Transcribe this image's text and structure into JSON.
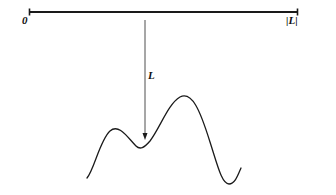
{
  "figure": {
    "title": "",
    "type": "mathematical-diagram",
    "width": 336,
    "height": 195,
    "background_color": "#ffffff",
    "stroke_color": "#1a1a1a"
  },
  "interval": {
    "name": "horizontal-interval-line",
    "left_label": "0",
    "right_label": "|L|",
    "x_start": 29,
    "x_end": 298,
    "y": 12,
    "stroke_width": 2.0,
    "endpoint_tick_height": 5
  },
  "arrow": {
    "name": "downward-mapping-arrow",
    "label": "L",
    "x": 145,
    "y_start": 20,
    "y_end": 140,
    "stroke_width": 0.9,
    "head_width": 5,
    "head_length": 9
  },
  "curve": {
    "name": "wavy-function-curve",
    "stroke_width": 1.3,
    "path": "M 87 178 C 94 170, 100 140, 110 131 C 119 123, 128 138, 136 146 C 140 150, 144 148, 150 141 C 160 128, 168 104, 180 97 C 192 91, 200 110, 210 142 C 218 167, 222 184, 229 184 C 235 184, 238 175, 241 168",
    "key_points": [
      {
        "label": "start",
        "x": 87,
        "y": 178
      },
      {
        "label": "local-maximum-left",
        "x": 110,
        "y": 130
      },
      {
        "label": "local-minimum-middle",
        "x": 142,
        "y": 148
      },
      {
        "label": "global-maximum",
        "x": 181,
        "y": 96
      },
      {
        "label": "global-minimum",
        "x": 227,
        "y": 184
      },
      {
        "label": "end",
        "x": 241,
        "y": 168
      }
    ]
  },
  "chart_data": {
    "type": "line",
    "title": "",
    "xlabel": "",
    "ylabel": "",
    "annotations": [
      "0",
      "|L|",
      "L"
    ],
    "grid": false,
    "legend": null
  }
}
